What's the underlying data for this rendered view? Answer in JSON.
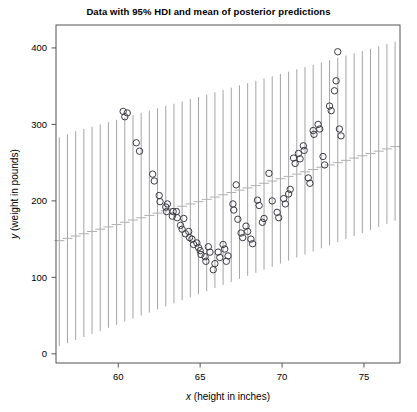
{
  "chart_data": {
    "type": "scatter",
    "title": "Data with 95% HDI and mean of posterior predictions",
    "xlabel_var": "x",
    "xlabel_rest": " (height in inches)",
    "ylabel_var": "y",
    "ylabel_rest": " (weight in pounds)",
    "xlim": [
      56.2,
      77.2
    ],
    "ylim": [
      -12,
      430
    ],
    "xticks": [
      60,
      65,
      70,
      75
    ],
    "xtick_labels": [
      "60",
      "65",
      "70",
      "75"
    ],
    "yticks": [
      0,
      100,
      200,
      300,
      400
    ],
    "ytick_labels": [
      "0",
      "100",
      "200",
      "300",
      "400"
    ],
    "grid": false,
    "legend": "none",
    "colors": {
      "point_stroke": "#3b3b44",
      "hdi_line": "#9a9a9a",
      "mean_dash": "#b0b0b0",
      "frame": "#555555",
      "text": "#000000",
      "background": "#ffffff"
    },
    "series": [
      {
        "name": "observed data",
        "marker": "open-circle",
        "points": [
          [
            60.3,
            317
          ],
          [
            60.4,
            310
          ],
          [
            60.55,
            315
          ],
          [
            61.1,
            276
          ],
          [
            61.3,
            265
          ],
          [
            62.1,
            235
          ],
          [
            62.2,
            226
          ],
          [
            62.5,
            207
          ],
          [
            62.55,
            199
          ],
          [
            62.9,
            192
          ],
          [
            62.95,
            186
          ],
          [
            63.0,
            196
          ],
          [
            63.3,
            180
          ],
          [
            63.35,
            186
          ],
          [
            63.55,
            186
          ],
          [
            63.6,
            178
          ],
          [
            63.8,
            168
          ],
          [
            63.9,
            163
          ],
          [
            64.0,
            177
          ],
          [
            64.1,
            157
          ],
          [
            64.3,
            160
          ],
          [
            64.35,
            152
          ],
          [
            64.5,
            150
          ],
          [
            64.6,
            143
          ],
          [
            64.8,
            145
          ],
          [
            64.9,
            139
          ],
          [
            65.0,
            135
          ],
          [
            65.05,
            130
          ],
          [
            65.3,
            127
          ],
          [
            65.35,
            121
          ],
          [
            65.5,
            140
          ],
          [
            65.6,
            133
          ],
          [
            65.8,
            110
          ],
          [
            65.9,
            118
          ],
          [
            66.1,
            133
          ],
          [
            66.2,
            126
          ],
          [
            66.4,
            143
          ],
          [
            66.5,
            137
          ],
          [
            66.6,
            121
          ],
          [
            66.7,
            128
          ],
          [
            67.0,
            196
          ],
          [
            67.05,
            188
          ],
          [
            67.2,
            221
          ],
          [
            67.3,
            176
          ],
          [
            67.5,
            158
          ],
          [
            67.6,
            152
          ],
          [
            67.8,
            167
          ],
          [
            67.9,
            160
          ],
          [
            68.1,
            150
          ],
          [
            68.2,
            144
          ],
          [
            68.5,
            201
          ],
          [
            68.6,
            194
          ],
          [
            68.8,
            172
          ],
          [
            68.9,
            177
          ],
          [
            69.2,
            236
          ],
          [
            69.4,
            200
          ],
          [
            69.7,
            185
          ],
          [
            69.8,
            178
          ],
          [
            70.1,
            203
          ],
          [
            70.2,
            196
          ],
          [
            70.4,
            209
          ],
          [
            70.5,
            215
          ],
          [
            70.7,
            256
          ],
          [
            70.8,
            249
          ],
          [
            71.0,
            262
          ],
          [
            71.1,
            255
          ],
          [
            71.3,
            272
          ],
          [
            71.35,
            266
          ],
          [
            71.6,
            230
          ],
          [
            71.7,
            223
          ],
          [
            71.9,
            292
          ],
          [
            71.95,
            287
          ],
          [
            72.2,
            300
          ],
          [
            72.3,
            294
          ],
          [
            72.5,
            258
          ],
          [
            72.6,
            247
          ],
          [
            72.9,
            324
          ],
          [
            73.0,
            318
          ],
          [
            73.2,
            344
          ],
          [
            73.3,
            357
          ],
          [
            73.4,
            395
          ],
          [
            73.5,
            294
          ],
          [
            73.6,
            285
          ]
        ]
      }
    ],
    "hdi_intervals": {
      "name": "95% HDI of posterior predictions",
      "description": "vertical grey line at each height value spanning the 95% highest density interval of posterior predicted weight, with a short horizontal dash at the posterior predictive mean",
      "x": [
        56.4,
        56.9,
        57.4,
        57.9,
        58.4,
        58.9,
        59.4,
        59.9,
        60.4,
        60.9,
        61.4,
        61.9,
        62.4,
        62.9,
        63.4,
        63.9,
        64.4,
        64.9,
        65.4,
        65.9,
        66.4,
        66.9,
        67.4,
        67.9,
        68.4,
        68.9,
        69.4,
        69.9,
        70.4,
        70.9,
        71.4,
        71.9,
        72.4,
        72.9,
        73.4,
        73.9,
        74.4,
        74.9,
        75.4,
        75.9,
        76.4,
        76.9
      ],
      "lower": [
        10,
        14,
        18,
        22,
        26,
        30,
        34,
        38,
        42,
        46,
        50,
        54,
        58,
        62,
        66,
        70,
        74,
        78,
        82,
        86,
        90,
        94,
        98,
        102,
        106,
        110,
        114,
        118,
        122,
        126,
        130,
        134,
        138,
        142,
        146,
        150,
        154,
        158,
        162,
        166,
        170,
        174
      ],
      "mean": [
        148,
        151,
        154,
        157,
        160,
        163,
        166,
        169,
        172,
        175,
        178,
        181,
        184,
        187,
        190,
        193,
        196,
        199,
        202,
        205,
        208,
        211,
        214,
        217,
        220,
        223,
        226,
        229,
        232,
        235,
        238,
        241,
        244,
        247,
        250,
        253,
        256,
        259,
        262,
        265,
        268,
        271
      ],
      "upper": [
        283,
        287,
        291,
        294,
        297,
        300,
        303,
        306,
        309,
        312,
        315,
        318,
        321,
        324,
        327,
        330,
        333,
        336,
        339,
        342,
        345,
        348,
        351,
        354,
        357,
        360,
        363,
        366,
        369,
        372,
        375,
        378,
        381,
        384,
        387,
        390,
        393,
        396,
        399,
        402,
        405,
        408
      ]
    }
  }
}
